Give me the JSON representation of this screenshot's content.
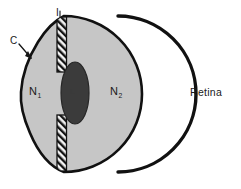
{
  "figure": {
    "type": "anatomical-optics-diagram"
  },
  "labels": {
    "iris": "I",
    "cornea": "C",
    "medium_anterior": "N",
    "medium_anterior_sub": "1",
    "medium_posterior": "N",
    "medium_posterior_sub": "2",
    "lens": "L",
    "retina": "Retina"
  },
  "colors": {
    "background": "#ffffff",
    "eye_fill": "#c6c6c6",
    "outline": "#111111",
    "lens_fill": "#3b3b3b",
    "iris_fill": "#f2f2f2",
    "iris_hatch": "#151515",
    "text": "#1a1a1a"
  },
  "geometry": {
    "globe_center_x": 118,
    "globe_center_y": 94,
    "globe_radius": 78,
    "cornea_bulge_left_x": 22,
    "lens_center_x": 75,
    "lens_center_y": 93,
    "lens_rx": 14,
    "lens_ry": 31,
    "iris_bar_x": 57,
    "iris_top_bar_y": 21,
    "iris_top_bar_height": 49,
    "iris_bottom_bar_y": 117,
    "iris_bottom_bar_height": 50,
    "iris_bar_width": 9
  }
}
